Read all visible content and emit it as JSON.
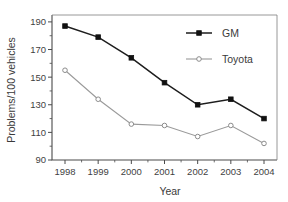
{
  "chart_data": {
    "type": "line",
    "title": "",
    "xlabel": "Year",
    "ylabel": "Problems/100 vehicles",
    "categories": [
      "1998",
      "1999",
      "2000",
      "2001",
      "2002",
      "2003",
      "2004"
    ],
    "x": [
      1998,
      1999,
      2000,
      2001,
      2002,
      2003,
      2004
    ],
    "xlim": [
      1997.5,
      2004.5
    ],
    "ylim": [
      90,
      195
    ],
    "yticks": [
      90,
      110,
      130,
      150,
      170,
      190
    ],
    "xticks": [
      "1998",
      "1999",
      "2000",
      "2001",
      "2002",
      "2003",
      "2004"
    ],
    "grid": false,
    "legend_position": "top-right",
    "series": [
      {
        "name": "GM",
        "color": "#1d1d1d",
        "marker": "filled-square",
        "values": [
          187,
          179,
          164,
          146,
          130,
          134,
          120
        ]
      },
      {
        "name": "Toyota",
        "color": "#9a9a9a",
        "marker": "open-circle",
        "values": [
          155,
          134,
          116,
          115,
          107,
          115,
          102
        ]
      }
    ]
  },
  "legend": {
    "entries": [
      {
        "label": "GM"
      },
      {
        "label": "Toyota"
      }
    ]
  },
  "axes": {
    "x_title": "Year",
    "y_title": "Problems/100 vehicles"
  }
}
